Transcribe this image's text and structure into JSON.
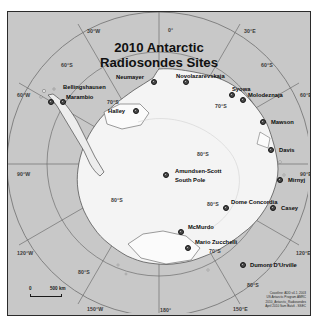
{
  "map": {
    "title_line1": "2010 Antarctic",
    "title_line2": "Radiosondes Sites",
    "projection_center_label": "South Pole",
    "background_color": "#c8c8c8",
    "land_color": "#f2f2f2",
    "graticule_color": "#6a6a6a",
    "marker_color": "#4a4a4a",
    "frame_color": "#2b2b2b"
  },
  "graticule": {
    "longitude_labels": [
      {
        "text": "0°",
        "x": 160,
        "y": 16
      },
      {
        "text": "30°E",
        "x": 236,
        "y": 17
      },
      {
        "text": "60°E",
        "x": 292,
        "y": 81
      },
      {
        "text": "90°E",
        "x": 292,
        "y": 160
      },
      {
        "text": "120°E",
        "x": 288,
        "y": 239
      },
      {
        "text": "150°E",
        "x": 225,
        "y": 295
      },
      {
        "text": "180°",
        "x": 152,
        "y": 296
      },
      {
        "text": "150°W",
        "x": 79,
        "y": 295
      },
      {
        "text": "120°W",
        "x": 9,
        "y": 239
      },
      {
        "text": "90°W",
        "x": 9,
        "y": 160
      },
      {
        "text": "60°W",
        "x": 9,
        "y": 81
      },
      {
        "text": "30°W",
        "x": 79,
        "y": 17
      }
    ],
    "latitude_labels": [
      {
        "text": "60°S",
        "x": 53,
        "y": 51
      },
      {
        "text": "60°S",
        "x": 253,
        "y": 51
      },
      {
        "text": "70°S",
        "x": 99,
        "y": 88
      },
      {
        "text": "70°S",
        "x": 207,
        "y": 92
      },
      {
        "text": "70°S",
        "x": 201,
        "y": 237
      },
      {
        "text": "80°S",
        "x": 189,
        "y": 140
      },
      {
        "text": "80°S",
        "x": 103,
        "y": 186
      },
      {
        "text": "80°S",
        "x": 199,
        "y": 190
      },
      {
        "text": "80°S",
        "x": 70,
        "y": 258
      },
      {
        "text": "80°S",
        "x": 239,
        "y": 271
      }
    ]
  },
  "stations": [
    {
      "name": "Bellingshausen",
      "dot_x": 43,
      "dot_y": 90,
      "label_x": 55,
      "label_y": 73,
      "align": "left"
    },
    {
      "name": "Marambio",
      "dot_x": 55,
      "dot_y": 90,
      "label_x": 58,
      "label_y": 83,
      "align": "left"
    },
    {
      "name": "Neumayer",
      "dot_x": 146,
      "dot_y": 70,
      "label_x": 108,
      "label_y": 63,
      "align": "left"
    },
    {
      "name": "Novolazarevskaja",
      "dot_x": 178,
      "dot_y": 70,
      "label_x": 168,
      "label_y": 62,
      "align": "left"
    },
    {
      "name": "Syowa",
      "dot_x": 224,
      "dot_y": 83,
      "label_x": 224,
      "label_y": 75,
      "align": "left"
    },
    {
      "name": "Molodeznaja",
      "dot_x": 235,
      "dot_y": 88,
      "label_x": 240,
      "label_y": 81,
      "align": "left"
    },
    {
      "name": "Halley",
      "dot_x": 128,
      "dot_y": 99,
      "label_x": 100,
      "label_y": 97,
      "align": "left"
    },
    {
      "name": "Mawson",
      "dot_x": 255,
      "dot_y": 110,
      "label_x": 263,
      "label_y": 108,
      "align": "left"
    },
    {
      "name": "Davis",
      "dot_x": 263,
      "dot_y": 138,
      "label_x": 271,
      "label_y": 136,
      "align": "left"
    },
    {
      "name": "Mirnyj",
      "dot_x": 272,
      "dot_y": 168,
      "label_x": 280,
      "label_y": 166,
      "align": "left"
    },
    {
      "name": "Amundsen-Scott",
      "dot_x": 158,
      "dot_y": 163,
      "label_x": 167,
      "label_y": 157,
      "align": "left"
    },
    {
      "name": "South Pole",
      "dot_x": null,
      "dot_y": null,
      "label_x": 167,
      "label_y": 166,
      "align": "left"
    },
    {
      "name": "Dome Concordia",
      "dot_x": 218,
      "dot_y": 196,
      "label_x": 223,
      "label_y": 188,
      "align": "left"
    },
    {
      "name": "Casey",
      "dot_x": 265,
      "dot_y": 196,
      "label_x": 273,
      "label_y": 194,
      "align": "left"
    },
    {
      "name": "McMurdo",
      "dot_x": 173,
      "dot_y": 220,
      "label_x": 180,
      "label_y": 213,
      "align": "left"
    },
    {
      "name": "Mario Zucchelli",
      "dot_x": 180,
      "dot_y": 236,
      "label_x": 187,
      "label_y": 228,
      "align": "left"
    },
    {
      "name": "Dumont D'Urville",
      "dot_x": 235,
      "dot_y": 253,
      "label_x": 242,
      "label_y": 251,
      "align": "left"
    }
  ],
  "scalebar": {
    "zero_label": "0",
    "distance_label": "500  km"
  },
  "credits": {
    "line1": "Coastline: ADD v4.1, 2003",
    "line2": "US Antarctic Program AMRC",
    "line3": "2010_Antarctic_Radiosondes",
    "line4": "April 2010 Sam Batzli - SSEC"
  }
}
